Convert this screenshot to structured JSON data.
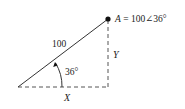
{
  "diagram": {
    "point_label": "A = 100∠36°",
    "point_var": "A",
    "point_expr": " = 100∠36°",
    "hypotenuse_label": "100",
    "angle_label": "36°",
    "vertical_label": "Y",
    "horizontal_label": "X",
    "colors": {
      "stroke": "#333333",
      "dashed": "#555555",
      "point": "#111111"
    }
  }
}
